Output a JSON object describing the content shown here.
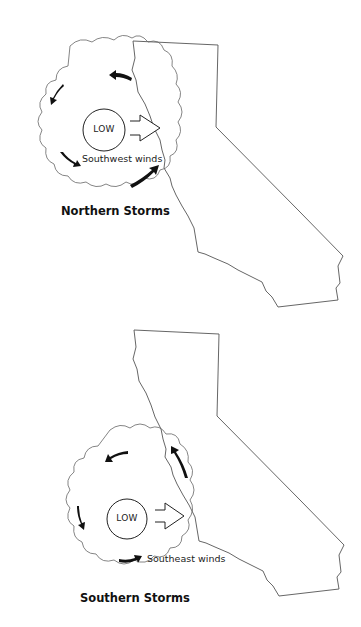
{
  "figure": {
    "panels": [
      {
        "id": "northern",
        "title": "Northern Storms",
        "pressure_label": "LOW",
        "wind_label": "Southwest winds",
        "wind_arrow_direction": "east",
        "circulation": "counter-clockwise"
      },
      {
        "id": "southern",
        "title": "Southern Storms",
        "pressure_label": "LOW",
        "wind_label": "Southeast winds",
        "wind_arrow_direction": "east",
        "circulation": "counter-clockwise"
      }
    ],
    "region": "California",
    "colors": {
      "outline": "#555555",
      "arrow": "#111111",
      "text": "#222222",
      "background": "#ffffff"
    }
  }
}
